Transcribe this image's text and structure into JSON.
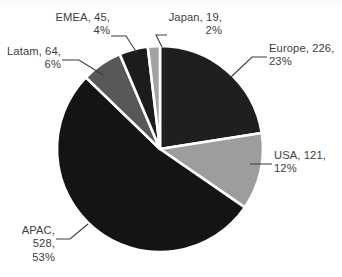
{
  "chart_data": {
    "type": "pie",
    "title": "",
    "xlabel": "",
    "ylabel": "",
    "categories": [
      "Europe",
      "USA",
      "APAC",
      "Latam",
      "EMEA",
      "Japan"
    ],
    "values": [
      226,
      121,
      528,
      64,
      45,
      19
    ],
    "percentages": [
      23,
      12,
      53,
      6,
      4,
      2
    ],
    "total": 1003,
    "legend": "none",
    "grid": false,
    "label_format": "name, value, percent",
    "start_angle_deg": -90,
    "direction": "clockwise",
    "slices": [
      {
        "name": "Europe",
        "value": 226,
        "percent": 23,
        "label": "Europe, 226,\n23%",
        "color": "#1f1f1f"
      },
      {
        "name": "USA",
        "value": 121,
        "percent": 12,
        "label": "USA, 121,\n12%",
        "color": "#9d9d9d"
      },
      {
        "name": "APAC",
        "value": 528,
        "percent": 53,
        "label": "APAC, 528,\n53%",
        "color": "#141414"
      },
      {
        "name": "Latam",
        "value": 64,
        "percent": 6,
        "label": "Latam, 64,\n6%",
        "color": "#585858"
      },
      {
        "name": "EMEA",
        "value": 45,
        "percent": 4,
        "label": "EMEA, 45,\n4%",
        "color": "#1c1c1c"
      },
      {
        "name": "Japan",
        "value": 19,
        "percent": 2,
        "label": "Japan, 19,\n2%",
        "color": "#a2a2a2"
      }
    ],
    "colors": {
      "background": "#ffffff",
      "slice_border": "#ffffff",
      "label_text": "#3d3d3d",
      "leader_line": "#3a3a3a"
    }
  }
}
